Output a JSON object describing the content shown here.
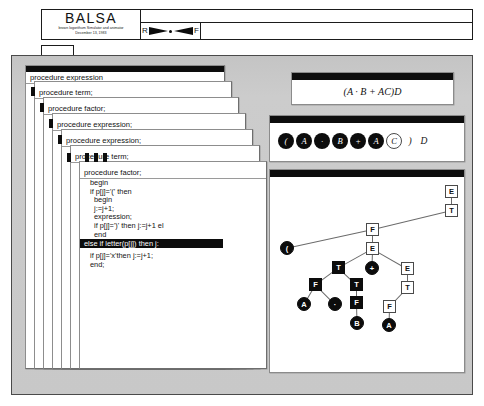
{
  "window": {
    "app_title": "BALSA",
    "subtitle_line1": "brown logorithum Simulator and animator",
    "subtitle_line2": "December 13, 1983",
    "scrubber": {
      "reverse_label": "R",
      "forward_label": "F",
      "handle_icon": "scrubber-dot-icon"
    }
  },
  "workspace": {
    "procedure_stack": [
      {
        "label": "procedure expression"
      },
      {
        "label": "procedure term;"
      },
      {
        "label": "procedure factor;"
      },
      {
        "label": "procedure expression;"
      },
      {
        "label": "procedure expression;"
      },
      {
        "label": "procedure term;"
      },
      {
        "label": "procedure factor;"
      }
    ],
    "code": {
      "title": "procedure factor;",
      "lines": [
        {
          "text": "begin",
          "indent": 1,
          "highlighted": false
        },
        {
          "text": "if p[j]='(' then",
          "indent": 1,
          "highlighted": false
        },
        {
          "text": "begin",
          "indent": 2,
          "highlighted": false
        },
        {
          "text": "j:=j+1;",
          "indent": 2,
          "highlighted": false
        },
        {
          "text": "expression;",
          "indent": 2,
          "highlighted": false
        },
        {
          "text": "if p[j]=')' then j:=j+1 el",
          "indent": 2,
          "highlighted": false
        },
        {
          "text": "end",
          "indent": 2,
          "highlighted": false
        },
        {
          "text": "else if letter(p[j]) then j:",
          "indent": 1,
          "highlighted": true
        },
        {
          "text": "",
          "indent": 0,
          "highlighted": false
        },
        {
          "text": "if p[j]='x'then j:=j+1;",
          "indent": 1,
          "highlighted": false
        },
        {
          "text": "end;",
          "indent": 1,
          "highlighted": false
        }
      ]
    },
    "formula_panel": {
      "expression": "(A · B + AC)D"
    },
    "token_panel": {
      "tokens": [
        {
          "text": "(",
          "state": "consumed"
        },
        {
          "text": "A",
          "state": "consumed"
        },
        {
          "text": "·",
          "state": "consumed"
        },
        {
          "text": "B",
          "state": "consumed"
        },
        {
          "text": "+",
          "state": "consumed"
        },
        {
          "text": "A",
          "state": "consumed"
        },
        {
          "text": "C",
          "state": "current"
        },
        {
          "text": ")",
          "state": "pending"
        },
        {
          "text": "D",
          "state": "pending"
        }
      ]
    },
    "parse_tree": {
      "nodes": [
        {
          "id": "n0",
          "label": "E",
          "shape": "square",
          "fill": "white",
          "x": 175,
          "y": 8
        },
        {
          "id": "n1",
          "label": "T",
          "shape": "square",
          "fill": "white",
          "x": 175,
          "y": 27
        },
        {
          "id": "n2",
          "label": "F",
          "shape": "square",
          "fill": "white",
          "x": 96,
          "y": 46
        },
        {
          "id": "n3",
          "label": "(",
          "shape": "circle",
          "fill": "black",
          "x": 10,
          "y": 64
        },
        {
          "id": "n4",
          "label": "E",
          "shape": "square",
          "fill": "white",
          "x": 96,
          "y": 65
        },
        {
          "id": "n5",
          "label": "T",
          "shape": "square",
          "fill": "black",
          "x": 62,
          "y": 84
        },
        {
          "id": "n6",
          "label": "+",
          "shape": "circle",
          "fill": "black",
          "x": 95,
          "y": 84
        },
        {
          "id": "n7",
          "label": "E",
          "shape": "square",
          "fill": "white",
          "x": 131,
          "y": 85
        },
        {
          "id": "n8",
          "label": "F",
          "shape": "square",
          "fill": "black",
          "x": 39,
          "y": 101
        },
        {
          "id": "n9",
          "label": "T",
          "shape": "square",
          "fill": "black",
          "x": 80,
          "y": 101
        },
        {
          "id": "n10",
          "label": "T",
          "shape": "square",
          "fill": "white",
          "x": 131,
          "y": 104
        },
        {
          "id": "n11",
          "label": "A",
          "shape": "circle",
          "fill": "black",
          "x": 27,
          "y": 120
        },
        {
          "id": "n12",
          "label": "·",
          "shape": "circle",
          "fill": "black",
          "x": 58,
          "y": 120
        },
        {
          "id": "n13",
          "label": "F",
          "shape": "square",
          "fill": "black",
          "x": 80,
          "y": 119
        },
        {
          "id": "n14",
          "label": "F",
          "shape": "square",
          "fill": "white",
          "x": 113,
          "y": 123
        },
        {
          "id": "n15",
          "label": "B",
          "shape": "circle",
          "fill": "black",
          "x": 80,
          "y": 139
        },
        {
          "id": "n16",
          "label": "A",
          "shape": "circle",
          "fill": "black",
          "x": 112,
          "y": 141
        }
      ],
      "edges": [
        [
          "n0",
          "n1"
        ],
        [
          "n1",
          "n2"
        ],
        [
          "n2",
          "n3"
        ],
        [
          "n2",
          "n4"
        ],
        [
          "n4",
          "n5"
        ],
        [
          "n4",
          "n6"
        ],
        [
          "n4",
          "n7"
        ],
        [
          "n5",
          "n8"
        ],
        [
          "n5",
          "n9"
        ],
        [
          "n7",
          "n10"
        ],
        [
          "n8",
          "n11"
        ],
        [
          "n8",
          "n12"
        ],
        [
          "n9",
          "n13"
        ],
        [
          "n10",
          "n14"
        ],
        [
          "n13",
          "n15"
        ],
        [
          "n14",
          "n16"
        ]
      ]
    }
  }
}
